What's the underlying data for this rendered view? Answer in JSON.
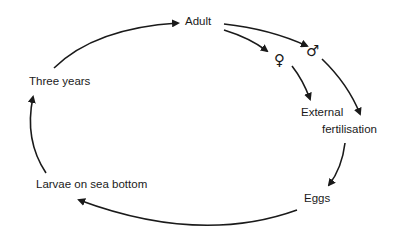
{
  "diagram": {
    "type": "life-cycle",
    "colors": {
      "stroke": "#1a1a1a",
      "background": "#ffffff"
    },
    "nodes": {
      "adult": "Adult",
      "female": "♀",
      "male": "♂",
      "external_fertilisation_line1": "External",
      "external_fertilisation_line2": "fertilisation",
      "eggs": "Eggs",
      "larvae": "Larvae on sea bottom",
      "three_years": "Three years"
    },
    "edges": [
      {
        "from": "Three years",
        "to": "Adult"
      },
      {
        "from": "Adult",
        "to": "♀"
      },
      {
        "from": "Adult",
        "to": "♂"
      },
      {
        "from": "♀",
        "to": "External fertilisation"
      },
      {
        "from": "♂",
        "to": "External fertilisation"
      },
      {
        "from": "External fertilisation",
        "to": "Eggs"
      },
      {
        "from": "Eggs",
        "to": "Larvae on sea bottom"
      },
      {
        "from": "Larvae on sea bottom",
        "to": "Three years"
      }
    ]
  }
}
